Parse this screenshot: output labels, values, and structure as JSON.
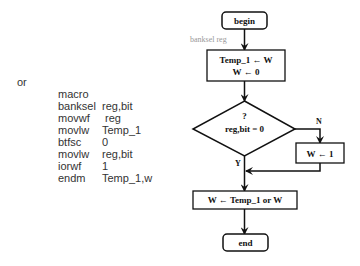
{
  "code": {
    "label": "or",
    "lines": [
      {
        "op": "macro",
        "arg": "reg,bit"
      },
      {
        "op": "banksel",
        "arg": " reg"
      },
      {
        "op": "movwf",
        "arg": "Temp_1"
      },
      {
        "op": "movlw",
        "arg": "0"
      },
      {
        "op": "btfsc",
        "arg": "reg,bit"
      },
      {
        "op": "movlw",
        "arg": "1"
      },
      {
        "op": "iorwf",
        "arg": "Temp_1,w"
      },
      {
        "op": "endm",
        "arg": ""
      }
    ]
  },
  "flowchart": {
    "begin": "begin",
    "annotation": "banksel reg",
    "step1_line1": "Temp_1 ← W",
    "step1_line2": "W ← 0",
    "decision_q": "?",
    "decision_cond": "reg,bit = 0",
    "branch_no": "N",
    "branch_yes": "Y",
    "no_step": "W ← 1",
    "step2": "W ← Temp_1 or W",
    "end": "end"
  },
  "colors": {
    "stroke": "#111111",
    "annotation": "#999999",
    "code_text": "#333333"
  }
}
